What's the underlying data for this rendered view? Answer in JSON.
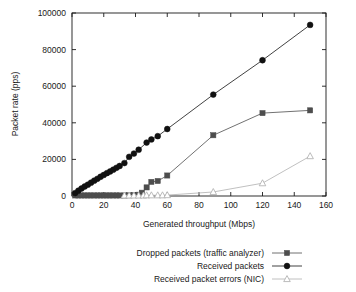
{
  "chart_data": {
    "type": "line",
    "title": "",
    "xlabel": "Generated throughput (Mbps)",
    "ylabel": "Packet rate (pps)",
    "xlim": [
      0,
      160
    ],
    "ylim": [
      0,
      100000
    ],
    "xticks": [
      0,
      20,
      40,
      60,
      80,
      100,
      120,
      140,
      160
    ],
    "xticklabels": [
      "0",
      "20",
      "40",
      "60",
      "80",
      "100",
      "120",
      "140",
      "160"
    ],
    "yticks": [
      0,
      20000,
      40000,
      60000,
      80000,
      100000
    ],
    "yticklabels": [
      "0",
      "20000",
      "40000",
      "60000",
      "80000",
      "100000"
    ],
    "grid": false,
    "legend_position": "bottom-right",
    "series": [
      {
        "name": "Dropped packets (traffic analyzer)",
        "marker": "square",
        "color": "#4d4d4d",
        "x": [
          2,
          4,
          6,
          8,
          10,
          12,
          14,
          16,
          18,
          20,
          22,
          24,
          26,
          28,
          30,
          33,
          36,
          39,
          42,
          44,
          47,
          50,
          54,
          60,
          89,
          120,
          150
        ],
        "y": [
          300,
          300,
          300,
          300,
          300,
          300,
          300,
          300,
          300,
          300,
          300,
          300,
          300,
          300,
          300,
          300,
          400,
          500,
          700,
          1800,
          4700,
          7700,
          8200,
          11200,
          33200,
          45300,
          46800
        ]
      },
      {
        "name": "Received packets",
        "marker": "circle",
        "color": "#111111",
        "x": [
          2,
          4,
          6,
          8,
          10,
          12,
          14,
          16,
          18,
          20,
          22,
          24,
          26,
          28,
          30,
          33,
          36,
          39,
          42,
          47,
          50,
          54,
          60,
          89,
          120,
          150
        ],
        "y": [
          1600,
          2900,
          4100,
          5200,
          6200,
          7300,
          8400,
          9400,
          10500,
          11500,
          12500,
          13400,
          14400,
          15400,
          16400,
          18000,
          21400,
          23200,
          25300,
          29200,
          30900,
          32700,
          36600,
          55400,
          74200,
          93500
        ]
      },
      {
        "name": "Received packet errors (NIC)",
        "marker": "triangle",
        "color": "#b0b0b0",
        "x": [
          33,
          36,
          39,
          42,
          45,
          47,
          50,
          54,
          57,
          60,
          89,
          120,
          150
        ],
        "y": [
          300,
          300,
          300,
          300,
          300,
          400,
          400,
          400,
          400,
          500,
          2200,
          7000,
          21800
        ]
      }
    ]
  },
  "legend": {
    "items": [
      {
        "label": "Dropped packets (traffic analyzer)",
        "marker": "square",
        "color": "#4d4d4d"
      },
      {
        "label": "Received packets",
        "marker": "circle",
        "color": "#111111"
      },
      {
        "label": "Received packet errors (NIC)",
        "marker": "triangle",
        "color": "#b0b0b0"
      }
    ]
  },
  "colors": {
    "dropped": "#4d4d4d",
    "received": "#111111",
    "errors": "#b0b0b0",
    "axis": "#1a1a1a",
    "background": "#ffffff"
  }
}
